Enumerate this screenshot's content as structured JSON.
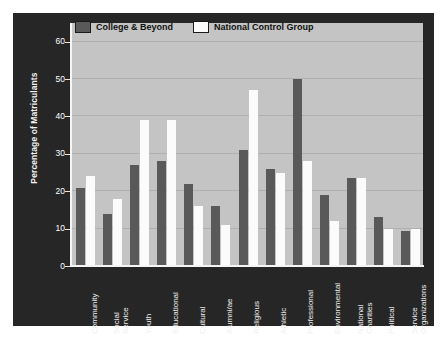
{
  "chart_data": {
    "type": "bar",
    "title": "",
    "xlabel": "",
    "ylabel": "Percentage of Matriculants",
    "ylim": [
      0,
      65
    ],
    "yticks": [
      0,
      10,
      20,
      30,
      40,
      50,
      60
    ],
    "grid": true,
    "legend_position": "top-left",
    "categories": [
      "Community",
      "Social Service",
      "Youth",
      "Educational",
      "Cultural",
      "Alumni/ae",
      "Religious",
      "Athletic",
      "Professional",
      "Environmental",
      "National Charities",
      "Political",
      "Service Organizations"
    ],
    "category_lines": [
      [
        "Community"
      ],
      [
        "Social",
        "Service"
      ],
      [
        "Youth"
      ],
      [
        "Educational"
      ],
      [
        "Cultural"
      ],
      [
        "Alumni/ae"
      ],
      [
        "Religious"
      ],
      [
        "Athletic"
      ],
      [
        "Professional"
      ],
      [
        "Environmental"
      ],
      [
        "National",
        "Charities"
      ],
      [
        "Political"
      ],
      [
        "Service",
        "Organizations"
      ]
    ],
    "series": [
      {
        "name": "College & Beyond",
        "color": "#595959",
        "values": [
          21,
          14,
          27,
          28,
          22,
          16,
          31,
          26,
          50,
          19,
          23.5,
          13,
          9.5
        ]
      },
      {
        "name": "National Control Group",
        "color": "#fbfbfb",
        "values": [
          24,
          18,
          39,
          39,
          16,
          11,
          47,
          25,
          28,
          12,
          23.5,
          10,
          10
        ]
      }
    ]
  },
  "legend": {
    "items": [
      {
        "label": "College & Beyond",
        "swatch_color": "#595959"
      },
      {
        "label": "National Control Group",
        "swatch_color": "#fbfbfb"
      }
    ]
  },
  "colors": {
    "figure_background": "#262626",
    "plot_background": "#c4c4c4",
    "gridline": "#b0b0b0",
    "axis": "#f5f5f5",
    "tick_text": "#ffffff",
    "series_1": "#595959",
    "series_2": "#fbfbfb"
  }
}
